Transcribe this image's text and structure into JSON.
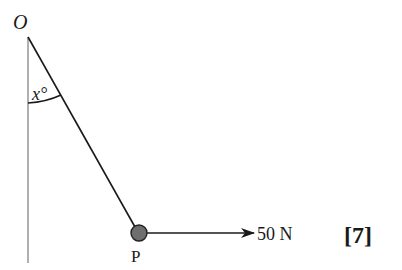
{
  "diagram": {
    "pivot_label": "O",
    "angle_label": "x°",
    "particle_label": "P",
    "force_label": "50 N",
    "marks_label": "[7]",
    "colors": {
      "string": "#1a1a1a",
      "vertical_line": "#b0b0b0",
      "particle_fill": "#6e6e6e",
      "particle_stroke": "#222222",
      "arrow": "#1a1a1a"
    }
  }
}
